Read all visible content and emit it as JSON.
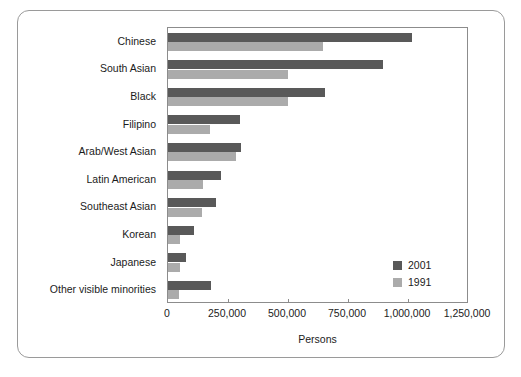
{
  "chart_data": {
    "type": "bar",
    "orientation": "horizontal",
    "title": "",
    "xlabel": "Persons",
    "ylabel": "",
    "xlim": [
      0,
      1250000
    ],
    "xticks": [
      0,
      250000,
      500000,
      750000,
      1000000,
      1250000
    ],
    "xticklabels": [
      "0",
      "250,000",
      "500,000",
      "750,000",
      "1,000,000",
      "1,250,000"
    ],
    "grid": false,
    "legend_position": "lower right",
    "categories": [
      "Chinese",
      "South Asian",
      "Black",
      "Filipino",
      "Arab/West Asian",
      "Latin American",
      "Southeast Asian",
      "Korean",
      "Japanese",
      "Other visible minorities"
    ],
    "series": [
      {
        "name": "2001",
        "color": "#595959",
        "values": [
          1015000,
          895000,
          655000,
          300000,
          305000,
          220000,
          200000,
          110000,
          75000,
          180000
        ]
      },
      {
        "name": "1991",
        "color": "#ababab",
        "values": [
          645000,
          500000,
          500000,
          175000,
          285000,
          145000,
          140000,
          50000,
          48000,
          45000
        ]
      }
    ]
  },
  "colors": {
    "series_2001": "#595959",
    "series_1991": "#ababab",
    "axis_line": "#8c8c8c",
    "frame_line": "#9a9a9a",
    "text": "#1b1b1b"
  },
  "legend": {
    "entries": [
      {
        "label": "2001",
        "color": "#595959"
      },
      {
        "label": "1991",
        "color": "#ababab"
      }
    ]
  }
}
